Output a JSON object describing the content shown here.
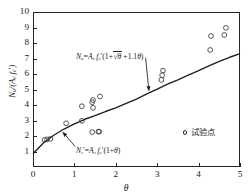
{
  "figure": {
    "ytitle_parts": {
      "n": "N",
      "nsub": "u",
      "slash": "/(",
      "a": "A",
      "asub": "c",
      "f": "f",
      "fsub": "c",
      "prime": "'",
      "close": ")"
    },
    "xtitle": "θ"
  },
  "annotations": {
    "upper": "Nu=Ac fc'(1+√θ+1.1θ)",
    "lower": "Ns'=Ac fc'(1+θ)"
  },
  "legend": {
    "marker": "circle-marker",
    "label": "试验点"
  },
  "chart_data": {
    "type": "scatter",
    "title": "",
    "xlabel": "θ",
    "ylabel": "Nu/(Ac fc')",
    "xlim": [
      0,
      5
    ],
    "ylim": [
      0,
      10
    ],
    "xticks": [
      0,
      1,
      2,
      3,
      4,
      5
    ],
    "yticks": [
      1,
      2,
      3,
      4,
      5,
      6,
      7,
      8,
      9,
      10
    ],
    "grid": false,
    "legend_position": "inside-right",
    "series": [
      {
        "name": "试验点",
        "type": "scatter",
        "marker": "open-circle",
        "points": [
          [
            0.28,
            1.75
          ],
          [
            0.34,
            1.78
          ],
          [
            0.42,
            1.82
          ],
          [
            0.8,
            2.82
          ],
          [
            1.18,
            2.98
          ],
          [
            1.18,
            3.92
          ],
          [
            1.43,
            2.25
          ],
          [
            1.43,
            4.18
          ],
          [
            1.45,
            3.82
          ],
          [
            1.45,
            4.32
          ],
          [
            1.58,
            2.28
          ],
          [
            1.6,
            2.28
          ],
          [
            1.62,
            4.55
          ],
          [
            3.1,
            5.62
          ],
          [
            3.12,
            5.92
          ],
          [
            3.14,
            6.22
          ],
          [
            4.28,
            7.55
          ],
          [
            4.3,
            8.45
          ],
          [
            4.62,
            8.52
          ],
          [
            4.66,
            8.98
          ]
        ]
      },
      {
        "name": "Nu=Ac fc'(1+√θ+1.1θ)",
        "type": "line",
        "points": [
          [
            0.0,
            0.85
          ],
          [
            0.25,
            1.55
          ],
          [
            0.5,
            2.05
          ],
          [
            0.75,
            2.45
          ],
          [
            1.0,
            2.78
          ],
          [
            1.25,
            3.08
          ],
          [
            1.5,
            3.32
          ],
          [
            1.75,
            3.58
          ],
          [
            2.0,
            3.82
          ],
          [
            2.25,
            4.1
          ],
          [
            2.5,
            4.38
          ],
          [
            2.75,
            4.72
          ],
          [
            3.0,
            5.02
          ],
          [
            3.25,
            5.34
          ],
          [
            3.5,
            5.62
          ],
          [
            3.75,
            5.92
          ],
          [
            4.0,
            6.22
          ],
          [
            4.25,
            6.52
          ],
          [
            4.5,
            6.82
          ],
          [
            4.75,
            7.08
          ],
          [
            5.0,
            7.32
          ]
        ]
      }
    ],
    "arrows": [
      {
        "from": [
          2.72,
          7.05
        ],
        "to": [
          2.8,
          4.92
        ],
        "label": "upper-formula-arrow"
      },
      {
        "from": [
          1.02,
          1.32
        ],
        "to": [
          0.72,
          2.25
        ],
        "label": "lower-formula-arrow"
      }
    ]
  }
}
